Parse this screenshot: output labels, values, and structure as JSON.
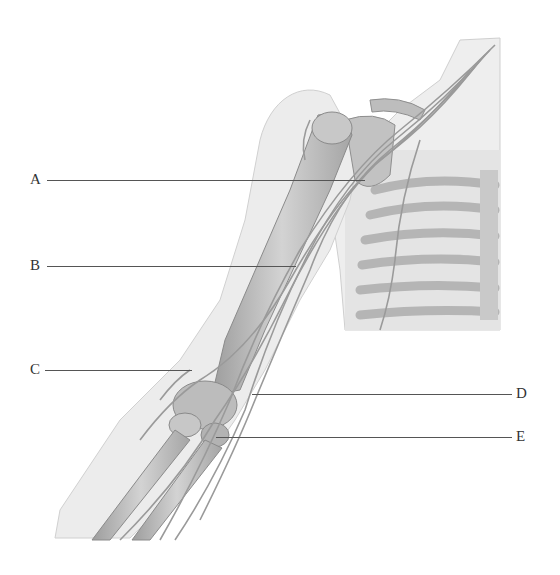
{
  "figure": {
    "style": "grayscale anatomical illustration",
    "colors": {
      "background": "#ffffff",
      "skin": "#e9e9e9",
      "bone": "#c4c4c4",
      "bone_shadow": "#9a9a9a",
      "nerve": "#d8d8d8",
      "nerve_outline": "#8a8a8a",
      "leader_line": "#555555",
      "label_text": "#333333"
    }
  },
  "labels": [
    {
      "id": "A",
      "text": "A",
      "side": "left",
      "y": 180,
      "line_x1": 47,
      "line_x2": 365
    },
    {
      "id": "B",
      "text": "B",
      "side": "left",
      "y": 266,
      "line_x1": 47,
      "line_x2": 296
    },
    {
      "id": "C",
      "text": "C",
      "side": "left",
      "y": 370,
      "line_x1": 45,
      "line_x2": 192
    },
    {
      "id": "D",
      "text": "D",
      "side": "right",
      "y": 394,
      "line_x1": 252,
      "line_x2": 512
    },
    {
      "id": "E",
      "text": "E",
      "side": "right",
      "y": 437,
      "line_x1": 216,
      "line_x2": 512
    }
  ]
}
